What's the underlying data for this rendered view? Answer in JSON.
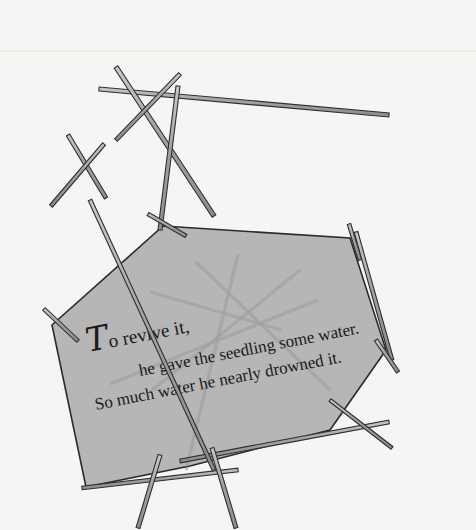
{
  "canvas": {
    "width": 476,
    "height": 530,
    "background_color": "#ffffff",
    "paper_color": "#f5f5f3",
    "top_rule_color": "#e2e2de"
  },
  "artwork": {
    "title": "To revive it, he gave the seedling some water. So much water he nearly drowned it.",
    "medium": "line-and-shape illustration",
    "description": "Scattered thin stick shapes overlaid by a translucent gray polygon panel bearing three lines of rotated serif text."
  },
  "panel": {
    "name": "gray-polygon-panel",
    "fill_color": "#adadad",
    "fill_opacity": 0.88,
    "stroke_color": "#2b2b2b",
    "points": "163,226 350,238 386,350 330,430 190,466 86,487 52,325"
  },
  "sticks": {
    "outline_color": "#2f2f2f",
    "body_color": "#9a9a9a",
    "body_highlight": "#c9c9c9",
    "under_panel_color": "#9d9d9d",
    "segments": [
      {
        "name": "stick-long-top-horizontal",
        "x1": 99,
        "y1": 89,
        "x2": 389,
        "y2": 115,
        "w": 4.0
      },
      {
        "name": "stick-upper-left-diagonal",
        "x1": 116,
        "y1": 67,
        "x2": 214,
        "y2": 216,
        "w": 4.2
      },
      {
        "name": "stick-upper-right-diagonal",
        "x1": 180,
        "y1": 74,
        "x2": 116,
        "y2": 140,
        "w": 3.6
      },
      {
        "name": "stick-vertical-center",
        "x1": 178,
        "y1": 86,
        "x2": 160,
        "y2": 230,
        "w": 4.0
      },
      {
        "name": "stick-mid-left-short",
        "x1": 68,
        "y1": 135,
        "x2": 106,
        "y2": 198,
        "w": 3.8
      },
      {
        "name": "stick-left-crossing",
        "x1": 104,
        "y1": 144,
        "x2": 51,
        "y2": 206,
        "w": 3.6
      },
      {
        "name": "stick-left-edge-cross",
        "x1": 44,
        "y1": 309,
        "x2": 78,
        "y2": 341,
        "w": 3.6
      },
      {
        "name": "stick-panel-top-left-cross",
        "x1": 148,
        "y1": 214,
        "x2": 186,
        "y2": 236,
        "w": 3.4
      },
      {
        "name": "stick-panel-top-right-cross",
        "x1": 349,
        "y1": 224,
        "x2": 360,
        "y2": 260,
        "w": 3.6
      },
      {
        "name": "stick-right-long-diagonal",
        "x1": 356,
        "y1": 232,
        "x2": 392,
        "y2": 360,
        "w": 3.8
      },
      {
        "name": "stick-right-lower-cross",
        "x1": 376,
        "y1": 340,
        "x2": 398,
        "y2": 372,
        "w": 3.6
      },
      {
        "name": "stick-bottom-right-horizontal",
        "x1": 180,
        "y1": 461,
        "x2": 389,
        "y2": 422,
        "w": 3.8
      },
      {
        "name": "stick-bottom-right-tail",
        "x1": 330,
        "y1": 400,
        "x2": 392,
        "y2": 448,
        "w": 3.4
      },
      {
        "name": "stick-bottom-left-horizontal",
        "x1": 82,
        "y1": 488,
        "x2": 238,
        "y2": 470,
        "w": 3.6
      },
      {
        "name": "stick-bottom-leg-left",
        "x1": 160,
        "y1": 455,
        "x2": 138,
        "y2": 528,
        "w": 4.0
      },
      {
        "name": "stick-bottom-leg-right",
        "x1": 212,
        "y1": 448,
        "x2": 236,
        "y2": 528,
        "w": 4.0
      },
      {
        "name": "stick-lower-left-long",
        "x1": 90,
        "y1": 200,
        "x2": 214,
        "y2": 470,
        "w": 3.8
      },
      {
        "name": "stick-under-panel-a",
        "x1": 196,
        "y1": 262,
        "x2": 330,
        "y2": 390,
        "w": 3.2
      },
      {
        "name": "stick-under-panel-b",
        "x1": 300,
        "y1": 270,
        "x2": 150,
        "y2": 392,
        "w": 3.2
      },
      {
        "name": "stick-under-panel-c",
        "x1": 238,
        "y1": 254,
        "x2": 186,
        "y2": 470,
        "w": 3.2
      },
      {
        "name": "stick-under-panel-d",
        "x1": 110,
        "y1": 384,
        "x2": 318,
        "y2": 300,
        "w": 3.2
      },
      {
        "name": "stick-under-panel-e",
        "x1": 150,
        "y1": 292,
        "x2": 282,
        "y2": 330,
        "w": 3.0
      }
    ]
  },
  "caption": {
    "rotation_degrees": -11,
    "lines": [
      {
        "name": "caption-line-1",
        "drop_cap": "T",
        "text": "o revive it,",
        "x": 88,
        "y": 352,
        "font_size": 19
      },
      {
        "name": "caption-line-2",
        "text": "he gave the seedling some water.",
        "x": 140,
        "y": 376,
        "font_size": 17
      },
      {
        "name": "caption-line-3",
        "text": "So much water he nearly drowned it.",
        "x": 96,
        "y": 410,
        "font_size": 17
      }
    ],
    "full_text": "To revive it, he gave the seedling some water. So much water he nearly drowned it."
  }
}
